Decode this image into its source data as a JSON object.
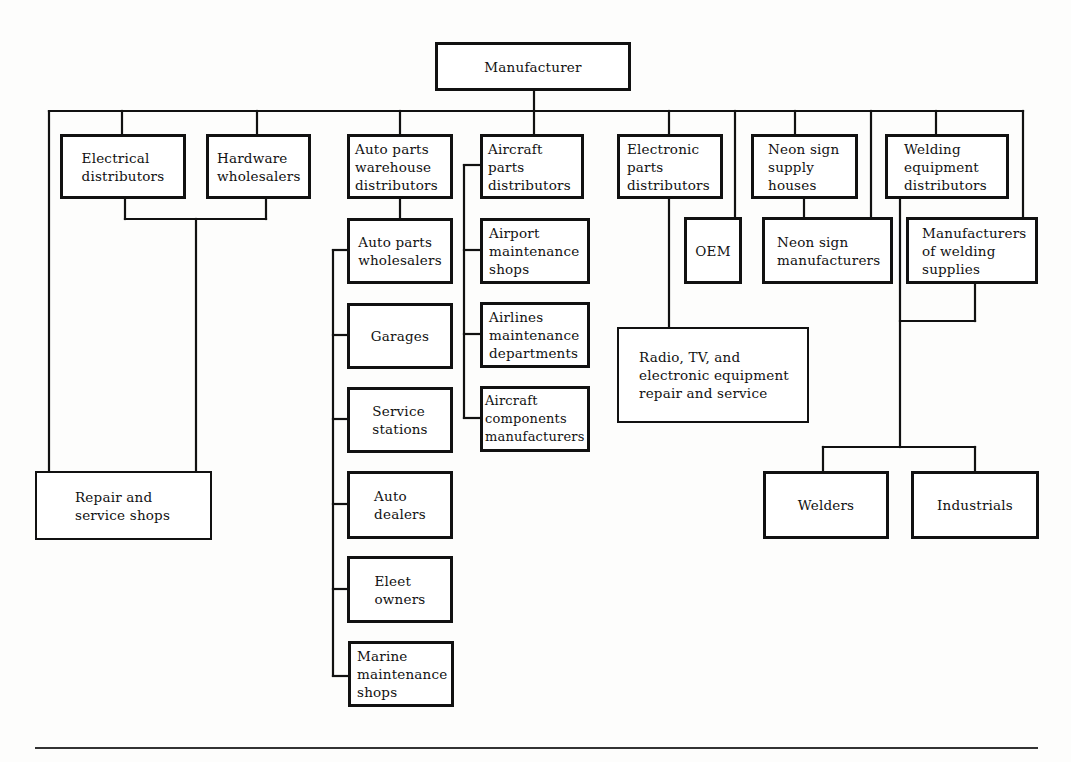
{
  "diagram": {
    "type": "distribution-channel-tree",
    "root": "Manufacturer",
    "nodes": {
      "manufacturer": "Manufacturer",
      "electrical_distributors": "Electrical\ndistributors",
      "hardware_wholesalers": "Hardware\nwholesalers",
      "auto_parts_warehouse_distributors": "Auto parts\nwarehouse\ndistributors",
      "aircraft_parts_distributors": "Aircraft\nparts\ndistributors",
      "electronic_parts_distributors": "Electronic\nparts\ndistributors",
      "neon_sign_supply_houses": "Neon sign\nsupply\nhouses",
      "welding_equipment_distributors": "Welding\nequipment\ndistributors",
      "repair_and_service_shops": "Repair and\nservice shops",
      "auto_parts_wholesalers": "Auto parts\nwholesalers",
      "garages": "Garages",
      "service_stations": "Service\nstations",
      "auto_dealers": "Auto\ndealers",
      "fleet_owners": "Eleet\nowners",
      "marine_maintenance_shops": "Marine\nmaintenance\nshops",
      "airport_maintenance_shops": "Airport\nmaintenance\nshops",
      "airlines_maintenance_departments": "Airlines\nmaintenance\ndepartments",
      "aircraft_components_manufacturers": "Aircraft\ncomponents\nmanufacturers",
      "oem": "OEM",
      "neon_sign_manufacturers": "Neon sign\nmanufacturers",
      "manufacturers_of_welding_supplies": "Manufacturers\nof welding\nsupplies",
      "radio_tv_repair": "Radio, TV, and\nelectronic equipment\nrepair and service",
      "welders": "Welders",
      "industrials": "Industrials"
    },
    "edges": [
      [
        "Manufacturer",
        "Electrical distributors"
      ],
      [
        "Manufacturer",
        "Hardware wholesalers"
      ],
      [
        "Manufacturer",
        "Repair and service shops"
      ],
      [
        "Manufacturer",
        "Auto parts warehouse distributors"
      ],
      [
        "Manufacturer",
        "Aircraft parts distributors"
      ],
      [
        "Manufacturer",
        "Electronic parts distributors"
      ],
      [
        "Manufacturer",
        "OEM"
      ],
      [
        "Manufacturer",
        "Neon sign supply houses"
      ],
      [
        "Manufacturer",
        "Neon sign manufacturers"
      ],
      [
        "Manufacturer",
        "Welding equipment distributors"
      ],
      [
        "Manufacturer",
        "Manufacturers of welding supplies"
      ],
      [
        "Electrical distributors",
        "Repair and service shops"
      ],
      [
        "Hardware wholesalers",
        "Repair and service shops"
      ],
      [
        "Auto parts warehouse distributors",
        "Auto parts wholesalers"
      ],
      [
        "Auto parts wholesalers",
        "Garages"
      ],
      [
        "Auto parts wholesalers",
        "Service stations"
      ],
      [
        "Auto parts wholesalers",
        "Auto dealers"
      ],
      [
        "Auto parts wholesalers",
        "Fleet owners"
      ],
      [
        "Auto parts wholesalers",
        "Marine maintenance shops"
      ],
      [
        "Aircraft parts distributors",
        "Airport maintenance shops"
      ],
      [
        "Aircraft parts distributors",
        "Airlines maintenance departments"
      ],
      [
        "Aircraft parts distributors",
        "Aircraft components manufacturers"
      ],
      [
        "Electronic parts distributors",
        "Radio, TV, and electronic equipment repair and service"
      ],
      [
        "Neon sign supply houses",
        "Neon sign manufacturers"
      ],
      [
        "Welding equipment distributors",
        "Welders"
      ],
      [
        "Welding equipment distributors",
        "Industrials"
      ],
      [
        "Manufacturers of welding supplies",
        "Welders"
      ],
      [
        "Manufacturers of welding supplies",
        "Industrials"
      ]
    ]
  }
}
